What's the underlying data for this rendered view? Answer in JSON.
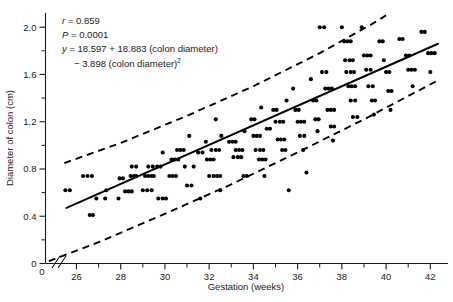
{
  "chart_data": {
    "type": "scatter",
    "title": "",
    "xlabel": "Gestation (weeks)",
    "ylabel": "Diameter of colon (cm)",
    "xlim": [
      24.6,
      42.8
    ],
    "ylim": [
      0,
      2.12
    ],
    "x_ticks": [
      26,
      28,
      30,
      32,
      34,
      36,
      38,
      40,
      42
    ],
    "x_tick_labels": [
      "26",
      "28",
      "30",
      "32",
      "34",
      "36",
      "38",
      "40",
      "42"
    ],
    "x_minor_ticks": [
      27,
      29,
      31,
      33,
      35,
      37,
      39,
      41
    ],
    "x_origin_label": "0",
    "y_ticks": [
      0,
      0.4,
      0.8,
      1.2,
      1.6,
      2.0
    ],
    "y_tick_labels": [
      "0",
      "0.4",
      "0.8",
      "1.2",
      "1.6",
      "2.0"
    ],
    "y_minor_ticks": [
      0.2,
      0.6,
      1.0,
      1.4,
      1.8
    ],
    "grid": false,
    "legend": "none",
    "axis_break": true,
    "annotations": [
      {
        "text": "r = 0.859",
        "italic_prefix": "r"
      },
      {
        "text": "P = 0.0001",
        "italic_prefix": "P"
      },
      {
        "text": "y = 18.597 + 18.883 (colon diameter)",
        "italic_prefix": "y"
      },
      {
        "text": "− 3.898 (colon diameter)",
        "superscript": "2"
      }
    ],
    "statistics": {
      "r": 0.859,
      "p_value": 0.0001,
      "equation_intercept": 18.597,
      "equation_linear_coef": 18.883,
      "equation_quadratic_coef": -3.898
    },
    "series": [
      {
        "name": "regression-line",
        "kind": "line",
        "style": "solid",
        "points": [
          [
            25.55,
            0.47
          ],
          [
            42.35,
            1.86
          ]
        ]
      },
      {
        "name": "upper-prediction-band",
        "kind": "line",
        "style": "dashed",
        "points": [
          [
            25.45,
            0.85
          ],
          [
            28.0,
            1.02
          ],
          [
            31.0,
            1.25
          ],
          [
            34.0,
            1.5
          ],
          [
            37.0,
            1.78
          ],
          [
            39.3,
            2.02
          ],
          [
            40.0,
            2.1
          ]
        ]
      },
      {
        "name": "lower-prediction-band",
        "kind": "line",
        "style": "dashed",
        "points": [
          [
            24.75,
            0.02
          ],
          [
            27.0,
            0.18
          ],
          [
            30.0,
            0.42
          ],
          [
            33.0,
            0.67
          ],
          [
            36.0,
            0.94
          ],
          [
            39.0,
            1.22
          ],
          [
            42.45,
            1.56
          ]
        ]
      },
      {
        "name": "colon-diameter-observations",
        "kind": "scatter",
        "marker": "filled-circle",
        "color": "#000000",
        "points": [
          [
            25.5,
            0.62
          ],
          [
            25.7,
            0.62
          ],
          [
            26.3,
            0.74
          ],
          [
            26.5,
            0.74
          ],
          [
            26.7,
            0.74
          ],
          [
            26.6,
            0.41
          ],
          [
            26.75,
            0.41
          ],
          [
            26.9,
            0.55
          ],
          [
            27.3,
            0.55
          ],
          [
            27.35,
            0.62
          ],
          [
            27.9,
            0.55
          ],
          [
            27.95,
            0.72
          ],
          [
            28.1,
            0.72
          ],
          [
            28.2,
            0.61
          ],
          [
            28.35,
            0.61
          ],
          [
            28.5,
            0.61
          ],
          [
            28.5,
            0.82
          ],
          [
            28.7,
            0.82
          ],
          [
            28.45,
            0.74
          ],
          [
            28.6,
            0.74
          ],
          [
            28.7,
            0.74
          ],
          [
            29.0,
            0.62
          ],
          [
            29.2,
            0.62
          ],
          [
            29.4,
            0.62
          ],
          [
            29.1,
            0.74
          ],
          [
            29.25,
            0.74
          ],
          [
            29.4,
            0.74
          ],
          [
            29.5,
            0.74
          ],
          [
            29.25,
            0.82
          ],
          [
            29.45,
            0.82
          ],
          [
            29.65,
            0.82
          ],
          [
            29.8,
            0.82
          ],
          [
            29.9,
            0.94
          ],
          [
            29.7,
            0.55
          ],
          [
            29.9,
            0.55
          ],
          [
            30.05,
            0.55
          ],
          [
            30.2,
            0.74
          ],
          [
            30.35,
            0.74
          ],
          [
            30.5,
            0.74
          ],
          [
            30.3,
            0.88
          ],
          [
            30.45,
            0.88
          ],
          [
            30.6,
            0.88
          ],
          [
            30.55,
            0.96
          ],
          [
            30.7,
            0.96
          ],
          [
            30.85,
            0.96
          ],
          [
            30.9,
            0.82
          ],
          [
            31.1,
            1.08
          ],
          [
            31.0,
            0.66
          ],
          [
            31.2,
            0.66
          ],
          [
            31.3,
            0.82
          ],
          [
            31.5,
            0.94
          ],
          [
            31.7,
            0.94
          ],
          [
            31.6,
            0.55
          ],
          [
            31.85,
            1.03
          ],
          [
            31.9,
            0.88
          ],
          [
            32.05,
            0.88
          ],
          [
            32.2,
            0.88
          ],
          [
            32.1,
            0.96
          ],
          [
            32.3,
            0.96
          ],
          [
            32.45,
            0.96
          ],
          [
            32.0,
            0.74
          ],
          [
            32.2,
            0.74
          ],
          [
            32.35,
            0.74
          ],
          [
            32.5,
            0.74
          ],
          [
            32.3,
            1.22
          ],
          [
            32.55,
            1.08
          ],
          [
            32.5,
            0.62
          ],
          [
            32.9,
            1.03
          ],
          [
            33.05,
            1.03
          ],
          [
            33.2,
            1.03
          ],
          [
            33.1,
            0.9
          ],
          [
            33.3,
            0.9
          ],
          [
            33.45,
            0.9
          ],
          [
            33.2,
            0.96
          ],
          [
            33.35,
            0.96
          ],
          [
            33.5,
            0.96
          ],
          [
            33.6,
            1.12
          ],
          [
            33.55,
            0.74
          ],
          [
            33.7,
            0.74
          ],
          [
            33.9,
            1.22
          ],
          [
            34.05,
            1.22
          ],
          [
            34.0,
            1.08
          ],
          [
            34.15,
            1.08
          ],
          [
            34.3,
            1.08
          ],
          [
            34.1,
            0.96
          ],
          [
            34.3,
            0.96
          ],
          [
            34.45,
            0.96
          ],
          [
            34.25,
            0.88
          ],
          [
            34.4,
            0.88
          ],
          [
            34.55,
            0.88
          ],
          [
            34.35,
            1.32
          ],
          [
            34.6,
            1.14
          ],
          [
            34.75,
            1.14
          ],
          [
            34.5,
            0.74
          ],
          [
            34.9,
            1.3
          ],
          [
            35.05,
            1.3
          ],
          [
            35.0,
            1.2
          ],
          [
            35.2,
            1.2
          ],
          [
            35.35,
            1.2
          ],
          [
            35.1,
            1.05
          ],
          [
            35.25,
            1.05
          ],
          [
            35.4,
            1.05
          ],
          [
            35.3,
            0.96
          ],
          [
            35.45,
            0.96
          ],
          [
            35.5,
            1.38
          ],
          [
            35.6,
            0.62
          ],
          [
            35.8,
            1.48
          ],
          [
            35.9,
            1.3
          ],
          [
            36.05,
            1.3
          ],
          [
            36.0,
            1.2
          ],
          [
            36.15,
            1.2
          ],
          [
            36.3,
            1.2
          ],
          [
            36.1,
            1.08
          ],
          [
            36.3,
            1.08
          ],
          [
            36.25,
            0.96
          ],
          [
            36.4,
            0.77
          ],
          [
            36.6,
            1.56
          ],
          [
            36.7,
            1.38
          ],
          [
            36.85,
            1.38
          ],
          [
            36.8,
            1.22
          ],
          [
            36.95,
            1.22
          ],
          [
            36.9,
            1.12
          ],
          [
            37.0,
            2.0
          ],
          [
            37.2,
            2.0
          ],
          [
            37.1,
            1.62
          ],
          [
            37.3,
            1.62
          ],
          [
            37.25,
            1.48
          ],
          [
            37.4,
            1.48
          ],
          [
            37.55,
            1.48
          ],
          [
            37.35,
            1.3
          ],
          [
            37.5,
            1.3
          ],
          [
            37.65,
            1.3
          ],
          [
            37.5,
            1.16
          ],
          [
            37.65,
            1.16
          ],
          [
            37.6,
            1.04
          ],
          [
            38.0,
            2.0
          ],
          [
            38.1,
            1.88
          ],
          [
            38.25,
            1.88
          ],
          [
            38.4,
            1.88
          ],
          [
            38.15,
            1.72
          ],
          [
            38.35,
            1.72
          ],
          [
            38.5,
            1.72
          ],
          [
            38.2,
            1.62
          ],
          [
            38.4,
            1.62
          ],
          [
            38.55,
            1.62
          ],
          [
            38.3,
            1.5
          ],
          [
            38.45,
            1.5
          ],
          [
            38.6,
            1.5
          ],
          [
            38.4,
            1.38
          ],
          [
            38.6,
            1.38
          ],
          [
            38.5,
            1.24
          ],
          [
            38.7,
            1.24
          ],
          [
            38.9,
            2.0
          ],
          [
            39.0,
            1.76
          ],
          [
            39.15,
            1.76
          ],
          [
            39.3,
            1.76
          ],
          [
            39.1,
            1.64
          ],
          [
            39.3,
            1.64
          ],
          [
            39.2,
            1.5
          ],
          [
            39.4,
            1.5
          ],
          [
            39.35,
            1.38
          ],
          [
            39.5,
            1.38
          ],
          [
            39.45,
            1.26
          ],
          [
            39.7,
            1.88
          ],
          [
            39.85,
            1.88
          ],
          [
            39.9,
            1.72
          ],
          [
            40.0,
            1.62
          ],
          [
            40.15,
            1.62
          ],
          [
            40.1,
            1.46
          ],
          [
            40.25,
            1.46
          ],
          [
            40.2,
            1.3
          ],
          [
            40.6,
            1.9
          ],
          [
            40.75,
            1.9
          ],
          [
            40.9,
            1.76
          ],
          [
            41.05,
            1.76
          ],
          [
            41.0,
            1.64
          ],
          [
            41.15,
            1.64
          ],
          [
            41.3,
            1.64
          ],
          [
            41.2,
            1.5
          ],
          [
            41.6,
            1.96
          ],
          [
            41.75,
            1.96
          ],
          [
            41.9,
            1.78
          ],
          [
            42.05,
            1.78
          ],
          [
            42.2,
            1.78
          ],
          [
            42.0,
            1.62
          ]
        ]
      }
    ]
  }
}
